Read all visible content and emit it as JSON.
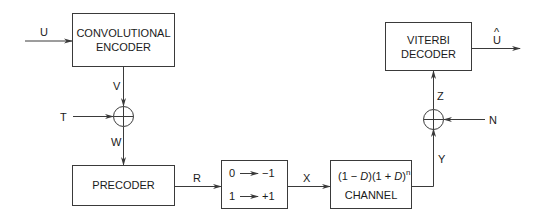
{
  "diagram": {
    "blocks": {
      "encoder": {
        "line1": "CONVOLUTIONAL",
        "line2": "ENCODER"
      },
      "precoder": {
        "label": "PRECODER"
      },
      "mapper": {
        "row1_in": "0",
        "row1_out": "−1",
        "row2_in": "1",
        "row2_out": "+1"
      },
      "channel": {
        "open1": "(1 − ",
        "D1": "D",
        "mid": ")(1 + ",
        "D2": "D",
        "close": ")",
        "exp": "n",
        "line2": "CHANNEL"
      },
      "decoder": {
        "line1": "VITERBI",
        "line2": "DECODER"
      }
    },
    "signals": {
      "U": "U",
      "V": "V",
      "T": "T",
      "W": "W",
      "R": "R",
      "X": "X",
      "Y": "Y",
      "N": "N",
      "Z": "Z",
      "U_hat": "U",
      "hat": "^"
    },
    "colors": {
      "stroke": "#3a3a3a",
      "text": "#1a1a1a"
    }
  }
}
